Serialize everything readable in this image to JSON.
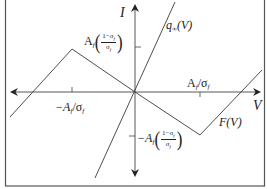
{
  "figure": {
    "axes": {
      "x_label": "V",
      "y_label": "I"
    },
    "curves": {
      "q_inf": {
        "label_main": "q",
        "label_sub": "∞",
        "label_arg": "(V)"
      },
      "F": {
        "label": "F(V)"
      }
    },
    "ticks": {
      "x_neg": {
        "prefix": "−A",
        "sub": "f",
        "slash": "/σ",
        "sub2": "f"
      },
      "x_pos": {
        "prefix": "A",
        "sub": "f",
        "slash": "/σ",
        "sub2": "f"
      },
      "y_pos": {
        "prefix": "A",
        "sub": "f",
        "num": "1−σ",
        "num_sub": "f",
        "den": "σ",
        "den_sub": "f"
      },
      "y_neg": {
        "prefix": "−A",
        "sub": "f",
        "num": "1−σ",
        "num_sub": "f",
        "den": "σ",
        "den_sub": "f"
      }
    },
    "colors": {
      "line": "#3a3a3a",
      "frame": "#555555",
      "background": "#ffffff"
    }
  }
}
